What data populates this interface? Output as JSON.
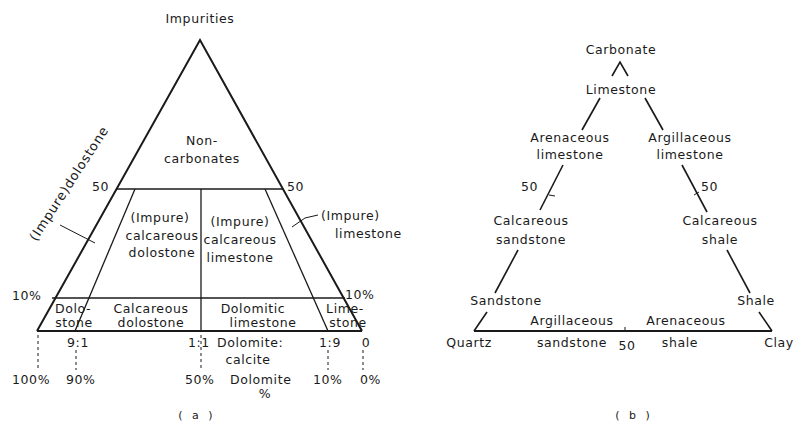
{
  "figure_a": {
    "caption": "( a )",
    "apex_label": "Impurities",
    "upper_region": [
      "Non-",
      "carbonates"
    ],
    "left_axis_label": "(Impure)dolostone",
    "right_leader_label": [
      "(Impure)",
      "limestone"
    ],
    "tick_50_left": "50",
    "tick_50_right": "50",
    "tick_10_left": "10%",
    "tick_10_right": "10%",
    "middle_regions": {
      "left": [
        "(Impure)",
        "calcareous",
        "dolostone"
      ],
      "right": [
        "(Impure)",
        "calcareous",
        "limestone"
      ]
    },
    "lower_regions": [
      [
        "Dolo-",
        "stone"
      ],
      [
        "Calcareous",
        "dolostone"
      ],
      [
        "Dolomitic",
        "limestone"
      ],
      [
        "Lime-",
        "stone"
      ]
    ],
    "ratio_ticks": [
      "9:1",
      "1:1",
      "1:9",
      "0"
    ],
    "ratio_axis_label": [
      "Dolomite:",
      "calcite"
    ],
    "percent_ticks": [
      "100%",
      "90%",
      "50%",
      "10%",
      "0%"
    ],
    "percent_axis_label": [
      "Dolomite",
      "%"
    ],
    "line_color": "#1a1a1a"
  },
  "figure_b": {
    "caption": "( b )",
    "apex": "Carbonate",
    "nodes": {
      "limestone": "Limestone",
      "arenaceous_limestone": [
        "Arenaceous",
        "limestone"
      ],
      "argillaceous_limestone": [
        "Argillaceous",
        "limestone"
      ],
      "calcareous_sandstone": [
        "Calcareous",
        "sandstone"
      ],
      "calcareous_shale": [
        "Calcareous",
        "shale"
      ],
      "sandstone": "Sandstone",
      "shale": "Shale",
      "quartz": "Quartz",
      "clay": "Clay",
      "argillaceous_sandstone": [
        "Argillaceous",
        "sandstone"
      ],
      "arenaceous_shale": [
        "Arenaceous",
        "shale"
      ]
    },
    "tick_50_left": "50",
    "tick_50_right": "50",
    "tick_50_base": "50"
  }
}
